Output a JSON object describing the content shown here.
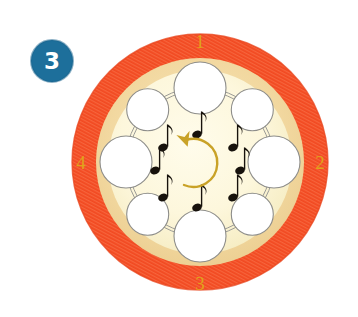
{
  "figure": {
    "name": "rhythm-wheel-diagram",
    "step_badge": {
      "label": "3",
      "fill_color": "#1d6f9b",
      "text_color": "#ffffff"
    },
    "beat_labels": [
      {
        "label": "1",
        "position": "top"
      },
      {
        "label": "2",
        "position": "right"
      },
      {
        "label": "3",
        "position": "bottom"
      },
      {
        "label": "4",
        "position": "left"
      }
    ],
    "colors": {
      "outer_ring": "#f0502b",
      "outer_ring_shade": "#ef623c",
      "mid_ring": "#f2d9a4",
      "inner_disc": "#fdf6dc",
      "note_color": "#17120c",
      "number_color": "#e0a31a",
      "arrow_color": "#c9a227",
      "circle_fill": "#ffffff",
      "circle_stroke": "#8a8a8a"
    },
    "center_arrow": {
      "name": "clockwise-rotation-arrow",
      "direction": "clockwise"
    },
    "beat_circles": [
      {
        "id": "circle-1",
        "angle": -90,
        "size": "large"
      },
      {
        "id": "circle-1a",
        "angle": -45,
        "size": "small"
      },
      {
        "id": "circle-2",
        "angle": 0,
        "size": "large"
      },
      {
        "id": "circle-2a",
        "angle": 45,
        "size": "small"
      },
      {
        "id": "circle-3",
        "angle": 90,
        "size": "large"
      },
      {
        "id": "circle-3a",
        "angle": 135,
        "size": "small"
      },
      {
        "id": "circle-4",
        "angle": 180,
        "size": "large"
      },
      {
        "id": "circle-4a",
        "angle": -135,
        "size": "small"
      }
    ],
    "eighth_notes": [
      {
        "id": "note-1",
        "angle": -90
      },
      {
        "id": "note-1a",
        "angle": -45
      },
      {
        "id": "note-2",
        "angle": 0
      },
      {
        "id": "note-2a",
        "angle": 45
      },
      {
        "id": "note-3",
        "angle": 90
      },
      {
        "id": "note-3a",
        "angle": 135
      },
      {
        "id": "note-4",
        "angle": 180
      },
      {
        "id": "note-4a",
        "angle": -135
      }
    ]
  }
}
